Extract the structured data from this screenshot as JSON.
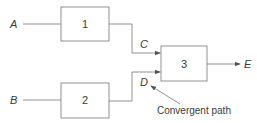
{
  "diagram": {
    "inputs": [
      {
        "id": "A",
        "label": "A"
      },
      {
        "id": "B",
        "label": "B"
      }
    ],
    "blocks": [
      {
        "id": "1",
        "label": "1"
      },
      {
        "id": "2",
        "label": "2"
      },
      {
        "id": "3",
        "label": "3"
      }
    ],
    "signals": [
      {
        "id": "C",
        "label": "C"
      },
      {
        "id": "D",
        "label": "D"
      }
    ],
    "output": {
      "id": "E",
      "label": "E"
    },
    "annotation": {
      "label": "Convergent path"
    },
    "edges": [
      {
        "from": "A",
        "to": "1"
      },
      {
        "from": "B",
        "to": "2"
      },
      {
        "from": "1",
        "to": "3",
        "signal": "C"
      },
      {
        "from": "2",
        "to": "3",
        "signal": "D"
      },
      {
        "from": "3",
        "to": "E"
      }
    ],
    "colors": {
      "stroke": "#6e6e6e",
      "text": "#3a3a3a"
    }
  }
}
